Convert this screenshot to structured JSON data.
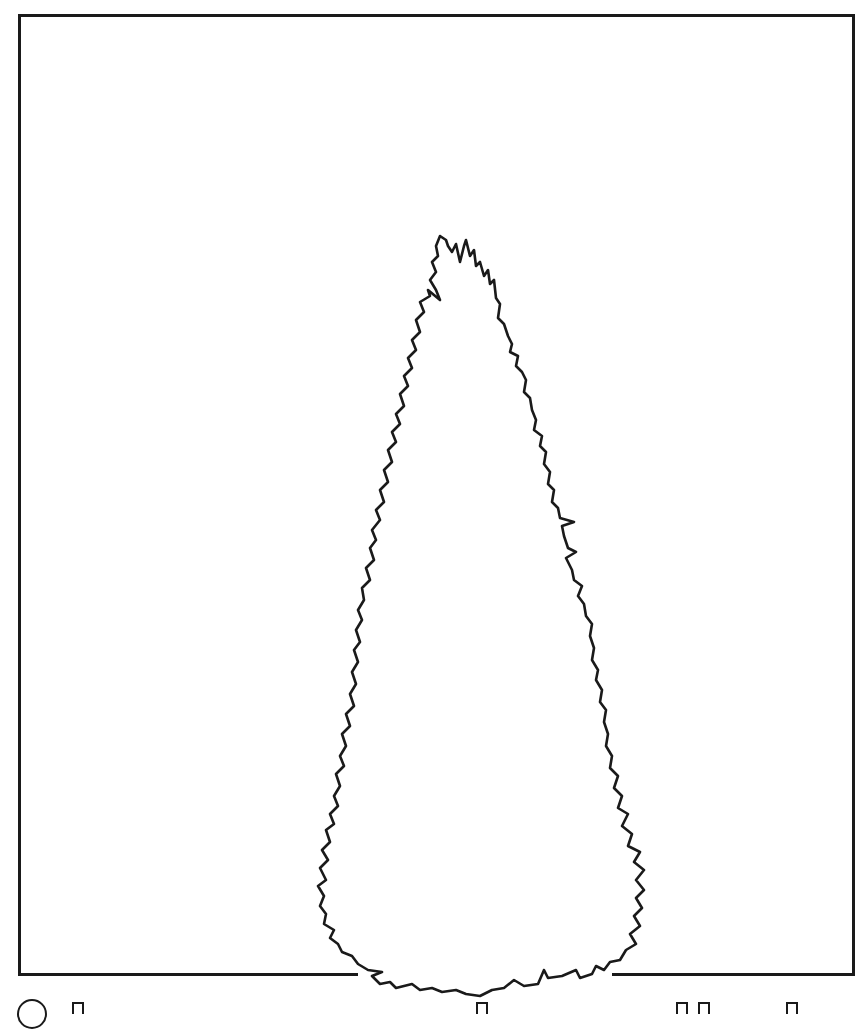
{
  "figure": {
    "title": "",
    "stroke_color": "#1a1a1a",
    "background_color": "#ffffff",
    "frame": {
      "left": 18,
      "top": 14,
      "right": 855,
      "bottom": 975
    },
    "silhouette": {
      "apex": {
        "x": 440,
        "y": 235
      },
      "widest_left_x": 320,
      "widest_right_x": 645,
      "base_y": 995
    }
  },
  "footer": {
    "note": "Clipped glyph tops visible along bottom edge",
    "glyph_positions_x": [
      30,
      75,
      480,
      680,
      702,
      790
    ]
  }
}
